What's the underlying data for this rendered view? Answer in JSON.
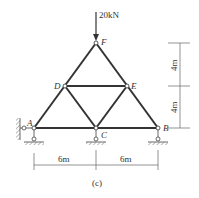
{
  "load": {
    "value": "20kN"
  },
  "nodes": {
    "A": "A",
    "B": "B",
    "C": "C",
    "D": "D",
    "E": "E",
    "F": "F"
  },
  "dimensions": {
    "horizontal": [
      "6m",
      "6m"
    ],
    "vertical": [
      "4m",
      "4m"
    ]
  },
  "caption": "(c)",
  "colors": {
    "member": "#333333",
    "line": "#555555"
  }
}
